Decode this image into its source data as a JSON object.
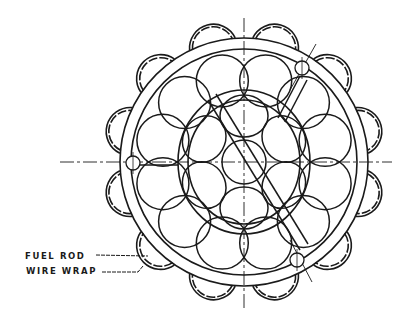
{
  "figure": {
    "type": "technical line drawing",
    "labels": [
      {
        "id": "fuel-rod",
        "text": "FUEL ROD"
      },
      {
        "id": "wire-wrap",
        "text": "WIRE WRAP"
      }
    ],
    "components": {
      "outer_wire_wraps": 12,
      "outer_rods": 12,
      "inner_rods": 6,
      "center_rod": 1,
      "inner_ring": 1,
      "outer_ring": 1,
      "locating_holes": 3
    },
    "colors": {
      "line": "#1a1a1a",
      "background": "#ffffff"
    }
  }
}
